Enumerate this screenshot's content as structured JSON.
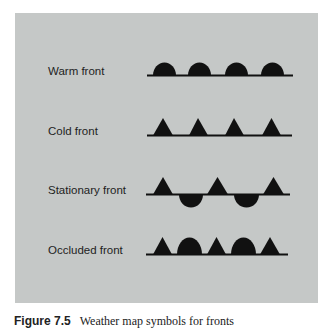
{
  "figure": {
    "background_color": "#c5c8c7",
    "symbol_color": "#111111",
    "caption_number": "Figure 7.5",
    "caption_text": "Weather map symbols for fronts"
  },
  "fronts": [
    {
      "label": "Warm front",
      "pattern": [
        "semicircle-up",
        "semicircle-up",
        "semicircle-up",
        "semicircle-up"
      ]
    },
    {
      "label": "Cold front",
      "pattern": [
        "triangle-up",
        "triangle-up",
        "triangle-up",
        "triangle-up"
      ]
    },
    {
      "label": "Stationary front",
      "pattern": [
        "triangle-up",
        "semicircle-down",
        "triangle-up",
        "semicircle-down",
        "triangle-up"
      ]
    },
    {
      "label": "Occluded front",
      "pattern": [
        "triangle-up",
        "semicircle-up",
        "triangle-up",
        "semicircle-up",
        "triangle-up"
      ]
    }
  ]
}
